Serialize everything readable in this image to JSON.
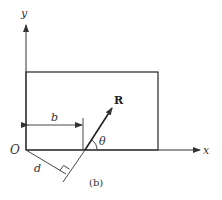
{
  "figure": {
    "caption": "(b)",
    "labels": {
      "y_axis": "y",
      "x_axis": "x",
      "origin": "O",
      "force": "R",
      "angle": "θ",
      "horizontal_distance": "b",
      "perpendicular_distance": "d"
    },
    "colors": {
      "line": "#333333",
      "background": "#ffffff"
    }
  }
}
